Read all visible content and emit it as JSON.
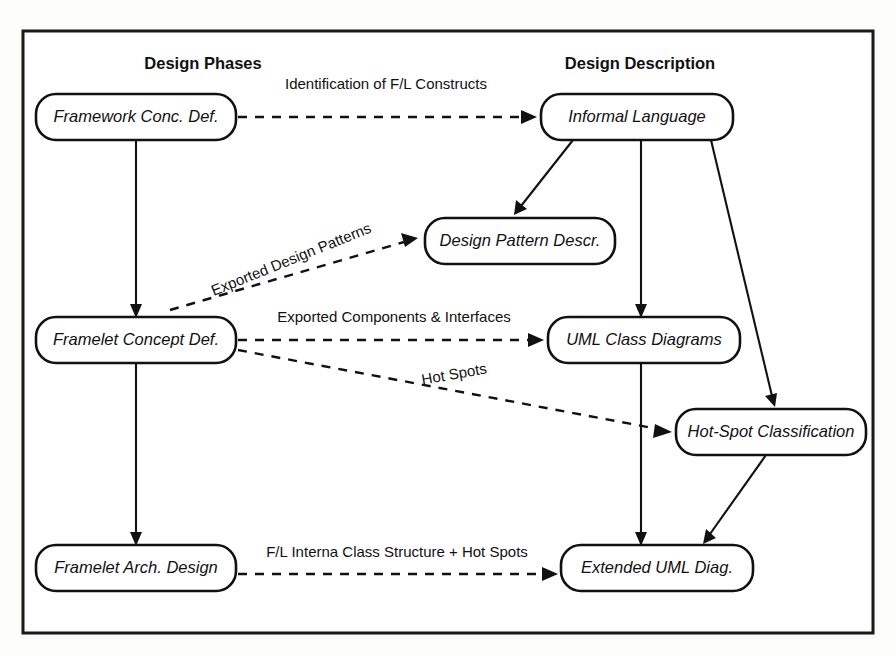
{
  "diagram": {
    "columns": [
      {
        "id": "design-phases",
        "label": "Design Phases",
        "x": 203,
        "y": 63
      },
      {
        "id": "design-description",
        "label": "Design Description",
        "x": 640,
        "y": 63
      }
    ],
    "nodes": [
      {
        "id": "framework-conc-def",
        "label": "Framework Conc. Def.",
        "x": 36,
        "y": 94,
        "w": 200,
        "h": 46
      },
      {
        "id": "informal-language",
        "label": "Informal Language",
        "x": 541,
        "y": 94,
        "w": 192,
        "h": 46
      },
      {
        "id": "design-pattern-descr",
        "label": "Design Pattern Descr.",
        "x": 425,
        "y": 218,
        "w": 190,
        "h": 46
      },
      {
        "id": "framelet-concept-def",
        "label": "Framelet Concept Def.",
        "x": 36,
        "y": 317,
        "w": 200,
        "h": 46
      },
      {
        "id": "uml-class-diagrams",
        "label": "UML Class Diagrams",
        "x": 548,
        "y": 317,
        "w": 192,
        "h": 46
      },
      {
        "id": "hot-spot-classification",
        "label": "Hot-Spot Classification",
        "x": 676,
        "y": 409,
        "w": 190,
        "h": 46
      },
      {
        "id": "framelet-arch-design",
        "label": "Framelet Arch. Design",
        "x": 36,
        "y": 545,
        "w": 200,
        "h": 46
      },
      {
        "id": "extended-uml-diag",
        "label": "Extended UML Diag.",
        "x": 561,
        "y": 545,
        "w": 192,
        "h": 46
      }
    ],
    "edges": [
      {
        "id": "identification-of-fl-constructs",
        "label": "Identification of F/L Constructs",
        "style": "dashed",
        "from": "framework-conc-def",
        "to": "informal-language",
        "label_x": 386,
        "label_y": 89,
        "label_rotation": 0
      },
      {
        "id": "exported-design-patterns",
        "label": "Exported Design Patterns",
        "style": "dashed",
        "from": "framelet-concept-def",
        "to": "design-pattern-descr",
        "label_x": 293,
        "label_y": 264,
        "label_rotation": -22
      },
      {
        "id": "exported-components-interfaces",
        "label": "Exported Components & Interfaces",
        "style": "dashed",
        "from": "framelet-concept-def",
        "to": "uml-class-diagrams",
        "label_x": 394,
        "label_y": 322,
        "label_rotation": 0
      },
      {
        "id": "hot-spots",
        "label": "Hot Spots",
        "style": "dashed",
        "from": "framelet-concept-def",
        "to": "hot-spot-classification",
        "label_x": 455,
        "label_y": 379,
        "label_rotation": -10
      },
      {
        "id": "fl-interna-class-structure-hot-spots",
        "label": "F/L Interna Class Structure + Hot Spots",
        "style": "dashed",
        "from": "framelet-arch-design",
        "to": "extended-uml-diag",
        "label_x": 397,
        "label_y": 557,
        "label_rotation": 0
      },
      {
        "id": "framework-to-framelet-concept",
        "label": "",
        "style": "solid",
        "from": "framework-conc-def",
        "to": "framelet-concept-def",
        "label_x": 0,
        "label_y": 0,
        "label_rotation": 0
      },
      {
        "id": "framelet-concept-to-arch-design",
        "label": "",
        "style": "solid",
        "from": "framelet-concept-def",
        "to": "framelet-arch-design",
        "label_x": 0,
        "label_y": 0,
        "label_rotation": 0
      },
      {
        "id": "informal-language-to-design-pattern",
        "label": "",
        "style": "solid",
        "from": "informal-language",
        "to": "design-pattern-descr",
        "label_x": 0,
        "label_y": 0,
        "label_rotation": 0
      },
      {
        "id": "informal-language-to-uml-class",
        "label": "",
        "style": "solid",
        "from": "informal-language",
        "to": "uml-class-diagrams",
        "label_x": 0,
        "label_y": 0,
        "label_rotation": 0
      },
      {
        "id": "informal-language-to-hot-spot",
        "label": "",
        "style": "solid",
        "from": "informal-language",
        "to": "hot-spot-classification",
        "label_x": 0,
        "label_y": 0,
        "label_rotation": 0
      },
      {
        "id": "uml-class-to-extended-uml",
        "label": "",
        "style": "solid",
        "from": "uml-class-diagrams",
        "to": "extended-uml-diag",
        "label_x": 0,
        "label_y": 0,
        "label_rotation": 0
      },
      {
        "id": "hot-spot-to-extended-uml",
        "label": "",
        "style": "solid",
        "from": "hot-spot-classification",
        "to": "extended-uml-diag",
        "label_x": 0,
        "label_y": 0,
        "label_rotation": 0
      }
    ],
    "colors": {
      "stroke": "#111111",
      "frame": "#1a1a1a",
      "background": "#ffffff",
      "page": "#fdfdfc"
    }
  }
}
